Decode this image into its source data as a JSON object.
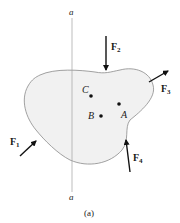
{
  "figure": {
    "caption": "(a)",
    "axis": {
      "top_label": "a",
      "bottom_label": "a"
    },
    "points": [
      {
        "name": "C",
        "label": "C"
      },
      {
        "name": "B",
        "label": "B"
      },
      {
        "name": "A",
        "label": "A"
      }
    ],
    "forces": [
      {
        "name": "F1",
        "letter": "F",
        "sub": "1"
      },
      {
        "name": "F2",
        "letter": "F",
        "sub": "2"
      },
      {
        "name": "F3",
        "letter": "F",
        "sub": "3"
      },
      {
        "name": "F4",
        "letter": "F",
        "sub": "4"
      }
    ],
    "colors": {
      "body_fill": "#f1f1f1",
      "outline": "#8a8a8a",
      "arrow": "#111111",
      "axis": "#a0a0a0"
    }
  }
}
